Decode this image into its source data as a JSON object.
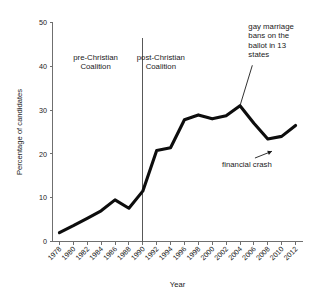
{
  "chart_data": {
    "type": "line",
    "title": "",
    "xlabel": "Year",
    "ylabel": "Percentage of candidates",
    "xlim": [
      1977,
      2013
    ],
    "ylim": [
      0,
      50
    ],
    "grid": false,
    "legend": "none",
    "x": [
      1978,
      1980,
      1982,
      1984,
      1986,
      1988,
      1990,
      1992,
      1994,
      1996,
      1998,
      2000,
      2002,
      2004,
      2006,
      2008,
      2010,
      2012
    ],
    "values": [
      2.0,
      3.6,
      5.3,
      7.0,
      9.5,
      7.6,
      11.5,
      20.8,
      21.4,
      27.8,
      28.9,
      28.0,
      28.7,
      31.0,
      27.0,
      23.4,
      24.0,
      26.5
    ],
    "series": [
      {
        "name": "Percentage of candidates",
        "values": [
          2.0,
          3.6,
          5.3,
          7.0,
          9.5,
          7.6,
          11.5,
          20.8,
          21.4,
          27.8,
          28.9,
          28.0,
          28.7,
          31.0,
          27.0,
          23.4,
          24.0,
          26.5
        ]
      }
    ],
    "xticks": [
      "1978",
      "1980",
      "1982",
      "1984",
      "1986",
      "1988",
      "1990",
      "1992",
      "1994",
      "1996",
      "1998",
      "2000",
      "2002",
      "2004",
      "2006",
      "2008",
      "2010",
      "2012"
    ],
    "yticks": [
      "0",
      "10",
      "20",
      "30",
      "40",
      "50"
    ],
    "ytick_values": [
      0,
      10,
      20,
      30,
      40,
      50
    ],
    "line_color": "#0d0d0d",
    "axis_color": "#6f6f6f",
    "annotations": [
      {
        "id": "pre-christian-coalition",
        "lines": [
          "pre-Christian",
          "Coalition"
        ],
        "x": 1983.2,
        "y": 41.5
      },
      {
        "id": "post-christian-coalition",
        "lines": [
          "post-Christian",
          "Coalition"
        ],
        "x": 1992.6,
        "y": 41.5
      },
      {
        "id": "gay-marriage-bans",
        "lines": [
          "gay marriage",
          "bans on the",
          "ballot in 13",
          "states"
        ],
        "x": 2005.2,
        "y": 48.5,
        "target_x": 2004,
        "target_y": 31.0
      },
      {
        "id": "financial-crash",
        "lines": [
          "financial crash"
        ],
        "x": 2005.0,
        "y": 17.0,
        "target_x": 2008.6,
        "target_y": 20.6
      }
    ],
    "divider": {
      "id": "christian-coalition-divider",
      "x": 1990,
      "y_top": 46.5,
      "y_bottom": 0
    }
  }
}
